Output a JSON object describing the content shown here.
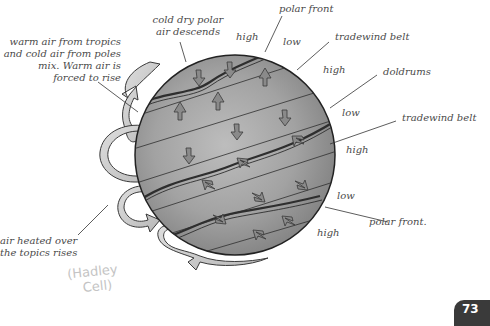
{
  "diagram": {
    "labels": {
      "warm_air_mix": [
        "warm air from tropics",
        "and cold air from poles",
        "mix.  Warm air is",
        "forced to rise"
      ],
      "cold_dry_polar": [
        "cold dry polar",
        "air descends"
      ],
      "polar_front_top": "polar front",
      "tradewind_belt_top": "tradewind belt",
      "doldrums": "doldrums",
      "tradewind_belt_bottom": "tradewind belt",
      "polar_front_bottom": "polar front.",
      "air_heated": [
        "air heated over",
        "the topics rises"
      ]
    },
    "pressure_labels": {
      "high_1": "high",
      "low_1": "low",
      "high_2": "high",
      "low_2": "low",
      "high_3": "high",
      "low_3": "low",
      "high_4": "high"
    },
    "handwritten_note": [
      "(Hadley",
      "Cell)"
    ],
    "colors": {
      "globe_fill": "#9a9a9a",
      "globe_light": "#c8c8c8",
      "outline": "#2a2a2a",
      "arrow_fill": "#8a8a8a",
      "cell_fill": "#cfcfcf",
      "label_text": "#4a4a4a"
    }
  },
  "page": {
    "number": "73"
  }
}
